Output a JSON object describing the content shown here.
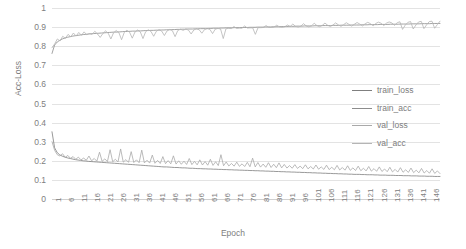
{
  "chart_data": {
    "type": "line",
    "title": "",
    "xlabel": "Epoch",
    "ylabel": "Acc-Loss",
    "ylim": [
      0,
      1
    ],
    "ytick_labels": [
      "1",
      "0.9",
      "0.8",
      "0.7",
      "0.6",
      "0.5",
      "0.4",
      "0.3",
      "0.2",
      "0.1",
      "0"
    ],
    "ytick_values": [
      1,
      0.9,
      0.8,
      0.7,
      0.6,
      0.5,
      0.4,
      0.3,
      0.2,
      0.1,
      0
    ],
    "grid": true,
    "legend_position": "right",
    "xtick_labels": [
      "1",
      "6",
      "11",
      "16",
      "21",
      "26",
      "31",
      "36",
      "41",
      "46",
      "51",
      "56",
      "61",
      "66",
      "71",
      "76",
      "81",
      "86",
      "91",
      "96",
      "101",
      "106",
      "111",
      "116",
      "121",
      "126",
      "131",
      "136",
      "141",
      "146"
    ],
    "x_range": [
      1,
      150
    ],
    "series": [
      {
        "name": "train_loss",
        "color": "#7f7f7f",
        "values": [
          0.352,
          0.268,
          0.243,
          0.231,
          0.224,
          0.219,
          0.215,
          0.212,
          0.209,
          0.206,
          0.204,
          0.202,
          0.2,
          0.199,
          0.197,
          0.196,
          0.195,
          0.194,
          0.193,
          0.192,
          0.191,
          0.19,
          0.189,
          0.188,
          0.187,
          0.186,
          0.185,
          0.184,
          0.183,
          0.182,
          0.181,
          0.18,
          0.179,
          0.178,
          0.177,
          0.176,
          0.175,
          0.174,
          0.173,
          0.172,
          0.171,
          0.17,
          0.169,
          0.168,
          0.168,
          0.167,
          0.166,
          0.165,
          0.165,
          0.164,
          0.163,
          0.163,
          0.162,
          0.161,
          0.161,
          0.16,
          0.159,
          0.159,
          0.158,
          0.158,
          0.157,
          0.157,
          0.156,
          0.156,
          0.155,
          0.155,
          0.154,
          0.154,
          0.153,
          0.153,
          0.152,
          0.152,
          0.151,
          0.151,
          0.15,
          0.15,
          0.149,
          0.149,
          0.148,
          0.148,
          0.147,
          0.147,
          0.146,
          0.146,
          0.145,
          0.145,
          0.144,
          0.144,
          0.143,
          0.143,
          0.142,
          0.142,
          0.141,
          0.141,
          0.14,
          0.14,
          0.139,
          0.139,
          0.138,
          0.138,
          0.137,
          0.137,
          0.136,
          0.136,
          0.135,
          0.135,
          0.134,
          0.134,
          0.133,
          0.133,
          0.132,
          0.132,
          0.131,
          0.131,
          0.13,
          0.13,
          0.129,
          0.129,
          0.129,
          0.128,
          0.128,
          0.127,
          0.127,
          0.127,
          0.126,
          0.126,
          0.125,
          0.125,
          0.125,
          0.124,
          0.124,
          0.124,
          0.123,
          0.123,
          0.123,
          0.122,
          0.122,
          0.122,
          0.121,
          0.121,
          0.121,
          0.12,
          0.12,
          0.12,
          0.119,
          0.119,
          0.119,
          0.118,
          0.118,
          0.118
        ]
      },
      {
        "name": "train_acc",
        "color": "#8c8c8c",
        "values": [
          0.762,
          0.806,
          0.822,
          0.831,
          0.838,
          0.843,
          0.847,
          0.85,
          0.853,
          0.855,
          0.857,
          0.859,
          0.861,
          0.862,
          0.864,
          0.865,
          0.866,
          0.867,
          0.868,
          0.869,
          0.87,
          0.871,
          0.872,
          0.873,
          0.874,
          0.874,
          0.875,
          0.876,
          0.877,
          0.877,
          0.878,
          0.879,
          0.879,
          0.88,
          0.88,
          0.881,
          0.882,
          0.882,
          0.883,
          0.883,
          0.884,
          0.884,
          0.885,
          0.885,
          0.886,
          0.886,
          0.887,
          0.887,
          0.888,
          0.888,
          0.889,
          0.889,
          0.89,
          0.89,
          0.89,
          0.891,
          0.891,
          0.892,
          0.892,
          0.892,
          0.893,
          0.893,
          0.894,
          0.894,
          0.894,
          0.895,
          0.895,
          0.896,
          0.896,
          0.896,
          0.897,
          0.897,
          0.897,
          0.898,
          0.898,
          0.898,
          0.899,
          0.899,
          0.899,
          0.9,
          0.9,
          0.9,
          0.901,
          0.901,
          0.901,
          0.902,
          0.902,
          0.902,
          0.903,
          0.903,
          0.903,
          0.904,
          0.904,
          0.904,
          0.905,
          0.905,
          0.905,
          0.906,
          0.906,
          0.906,
          0.906,
          0.907,
          0.907,
          0.907,
          0.908,
          0.908,
          0.908,
          0.908,
          0.909,
          0.909,
          0.909,
          0.91,
          0.91,
          0.91,
          0.91,
          0.911,
          0.911,
          0.911,
          0.911,
          0.912,
          0.912,
          0.912,
          0.913,
          0.913,
          0.913,
          0.913,
          0.914,
          0.914,
          0.914,
          0.914,
          0.915,
          0.915,
          0.915,
          0.915,
          0.916,
          0.916,
          0.916,
          0.916,
          0.917,
          0.917,
          0.917,
          0.917,
          0.918,
          0.918,
          0.918,
          0.918,
          0.919,
          0.919,
          0.919,
          0.919
        ]
      },
      {
        "name": "val_loss",
        "color": "#a9a9a9",
        "values": [
          0.3,
          0.255,
          0.232,
          0.225,
          0.237,
          0.218,
          0.228,
          0.213,
          0.222,
          0.208,
          0.219,
          0.205,
          0.214,
          0.203,
          0.225,
          0.2,
          0.212,
          0.198,
          0.245,
          0.197,
          0.21,
          0.196,
          0.258,
          0.195,
          0.208,
          0.194,
          0.262,
          0.193,
          0.206,
          0.192,
          0.248,
          0.191,
          0.205,
          0.19,
          0.256,
          0.189,
          0.203,
          0.188,
          0.23,
          0.187,
          0.202,
          0.186,
          0.222,
          0.185,
          0.201,
          0.184,
          0.226,
          0.183,
          0.2,
          0.182,
          0.198,
          0.181,
          0.212,
          0.18,
          0.197,
          0.179,
          0.205,
          0.178,
          0.196,
          0.177,
          0.208,
          0.176,
          0.195,
          0.175,
          0.232,
          0.174,
          0.194,
          0.173,
          0.186,
          0.172,
          0.193,
          0.171,
          0.184,
          0.17,
          0.192,
          0.169,
          0.214,
          0.168,
          0.191,
          0.167,
          0.183,
          0.166,
          0.19,
          0.165,
          0.182,
          0.164,
          0.189,
          0.163,
          0.181,
          0.162,
          0.175,
          0.161,
          0.18,
          0.16,
          0.172,
          0.159,
          0.179,
          0.158,
          0.17,
          0.157,
          0.178,
          0.156,
          0.168,
          0.155,
          0.177,
          0.154,
          0.166,
          0.153,
          0.176,
          0.152,
          0.165,
          0.151,
          0.174,
          0.15,
          0.163,
          0.149,
          0.172,
          0.148,
          0.161,
          0.147,
          0.17,
          0.146,
          0.159,
          0.145,
          0.168,
          0.144,
          0.157,
          0.143,
          0.166,
          0.142,
          0.155,
          0.141,
          0.164,
          0.14,
          0.153,
          0.139,
          0.162,
          0.138,
          0.151,
          0.137,
          0.16,
          0.136,
          0.149,
          0.135,
          0.158,
          0.134,
          0.147,
          0.133
        ]
      },
      {
        "name": "val_acc",
        "color": "#b5b5b5",
        "values": [
          0.792,
          0.812,
          0.838,
          0.827,
          0.852,
          0.841,
          0.862,
          0.849,
          0.869,
          0.853,
          0.872,
          0.857,
          0.875,
          0.86,
          0.866,
          0.862,
          0.878,
          0.864,
          0.846,
          0.866,
          0.88,
          0.868,
          0.838,
          0.87,
          0.882,
          0.871,
          0.834,
          0.872,
          0.884,
          0.873,
          0.842,
          0.874,
          0.885,
          0.875,
          0.84,
          0.876,
          0.886,
          0.877,
          0.852,
          0.878,
          0.887,
          0.879,
          0.856,
          0.88,
          0.888,
          0.881,
          0.85,
          0.882,
          0.889,
          0.883,
          0.89,
          0.884,
          0.864,
          0.885,
          0.891,
          0.886,
          0.868,
          0.887,
          0.892,
          0.888,
          0.866,
          0.889,
          0.893,
          0.89,
          0.84,
          0.891,
          0.894,
          0.892,
          0.903,
          0.893,
          0.895,
          0.894,
          0.906,
          0.895,
          0.896,
          0.896,
          0.862,
          0.897,
          0.897,
          0.898,
          0.908,
          0.899,
          0.898,
          0.9,
          0.91,
          0.901,
          0.899,
          0.902,
          0.911,
          0.903,
          0.916,
          0.904,
          0.9,
          0.905,
          0.918,
          0.906,
          0.901,
          0.907,
          0.92,
          0.908,
          0.902,
          0.909,
          0.921,
          0.91,
          0.903,
          0.911,
          0.922,
          0.912,
          0.904,
          0.913,
          0.923,
          0.914,
          0.905,
          0.915,
          0.924,
          0.916,
          0.906,
          0.917,
          0.925,
          0.918,
          0.907,
          0.919,
          0.926,
          0.92,
          0.908,
          0.921,
          0.927,
          0.922,
          0.909,
          0.923,
          0.928,
          0.888,
          0.91,
          0.925,
          0.929,
          0.89,
          0.911,
          0.927,
          0.93,
          0.892,
          0.912,
          0.929,
          0.931,
          0.894,
          0.913,
          0.931
        ]
      }
    ]
  },
  "legend": {
    "entries": [
      {
        "label": "train_loss"
      },
      {
        "label": "train_acc"
      },
      {
        "label": "val_loss"
      },
      {
        "label": "val_acc"
      }
    ]
  }
}
